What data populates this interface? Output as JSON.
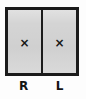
{
  "diagram": {
    "colors": {
      "background": "#fdfdfd",
      "box_fill": "#d4d4d4",
      "border": "#1b1b1b",
      "mark": "#151515",
      "label_text": "#141414"
    },
    "cells": [
      {
        "id": "cell-r",
        "mark": "×",
        "mark_icon": "x-mark-icon",
        "checked": true,
        "label": "R"
      },
      {
        "id": "cell-l",
        "mark": "×",
        "mark_icon": "x-mark-icon",
        "checked": true,
        "label": "L"
      }
    ]
  }
}
